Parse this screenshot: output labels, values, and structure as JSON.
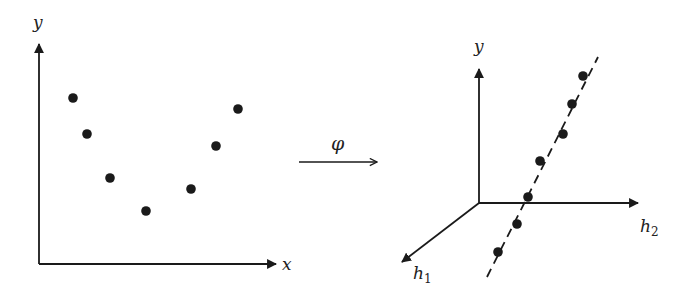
{
  "colors": {
    "ink": "#1a1a1a",
    "background": "#ffffff"
  },
  "left_plot": {
    "y_axis_label": "y",
    "x_axis_label": "x",
    "points": [
      {
        "x": 73,
        "y": 98
      },
      {
        "x": 87,
        "y": 134
      },
      {
        "x": 110,
        "y": 178
      },
      {
        "x": 146,
        "y": 211
      },
      {
        "x": 191,
        "y": 189
      },
      {
        "x": 216,
        "y": 146
      },
      {
        "x": 238,
        "y": 109
      }
    ]
  },
  "mapping_arrow": {
    "label": "φ"
  },
  "right_plot": {
    "y_axis_label": "y",
    "h1_label": "h",
    "h1_subscript": "1",
    "h2_label": "h",
    "h2_subscript": "2",
    "points": [
      {
        "x": 583,
        "y": 76
      },
      {
        "x": 572,
        "y": 104
      },
      {
        "x": 563,
        "y": 134
      },
      {
        "x": 540,
        "y": 161
      },
      {
        "x": 528,
        "y": 197
      },
      {
        "x": 517,
        "y": 224
      },
      {
        "x": 498,
        "y": 252
      }
    ],
    "separator_line": {
      "style": "dashed"
    }
  }
}
